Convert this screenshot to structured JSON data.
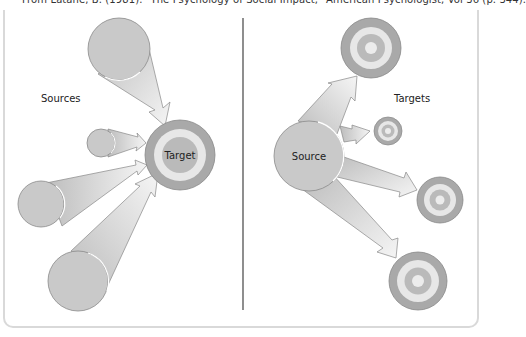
{
  "caption": "From Latané, B. (1981). \"The Psychology of Social Impact,\" American Psychologist, Vol 36 (p. 344).",
  "left_panel": {
    "group_label": "Sources",
    "target_label": "Target",
    "description": "Multiple sources converging on a single target"
  },
  "right_panel": {
    "source_label": "Source",
    "group_label": "Targets",
    "description": "A single source diverging to multiple targets"
  },
  "colors": {
    "source_fill": "#c8c8c8",
    "source_stroke": "#8a8a8a",
    "arrow_fill_dark": "#c4c4c4",
    "arrow_fill_light": "#f4f4f4",
    "target_outer": "#a9a9a9",
    "target_ring2": "#e6e6e6",
    "target_ring3": "#b9b9b9",
    "target_center": "#ececec",
    "divider": "#444444",
    "frame": "#d9d9d9"
  }
}
